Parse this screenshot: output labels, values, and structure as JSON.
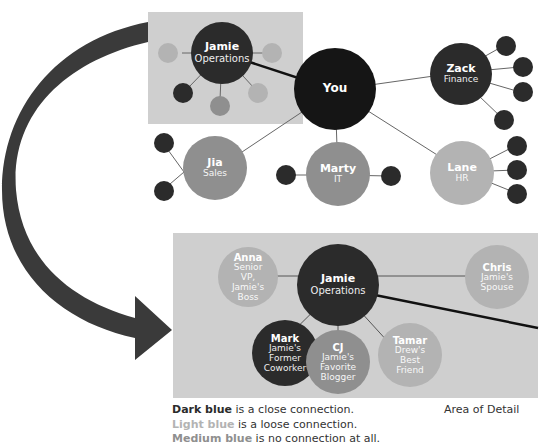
{
  "colors": {
    "dark": "#2b2b2b",
    "center": "#151515",
    "medium": "#8f8f8f",
    "light": "#b3b3b3",
    "panel": "#cfcfcf",
    "arrow": "#3a3a3a",
    "line": "#666666"
  },
  "top_network": {
    "center": {
      "name": "You"
    },
    "nodes": [
      {
        "name": "Jamie",
        "sub": "Operations"
      },
      {
        "name": "Zack",
        "sub": "Finance"
      },
      {
        "name": "Jia",
        "sub": "Sales"
      },
      {
        "name": "Marty",
        "sub": "IT"
      },
      {
        "name": "Lane",
        "sub": "HR"
      }
    ]
  },
  "detail": {
    "center": {
      "name": "Jamie",
      "sub": "Operations"
    },
    "nodes": [
      {
        "name": "Anna",
        "sub": "Senior VP, Jamie's Boss",
        "lines": [
          "Senior",
          "VP,",
          "Jamie's",
          "Boss"
        ]
      },
      {
        "name": "Chris",
        "sub": "Jamie's Spouse",
        "lines": [
          "Jamie's",
          "Spouse"
        ]
      },
      {
        "name": "Mark",
        "sub": "Jamie's Former Coworker",
        "lines": [
          "Jamie's",
          "Former",
          "Coworker"
        ]
      },
      {
        "name": "CJ",
        "sub": "Jamie's Favorite Blogger",
        "lines": [
          "Jamie's",
          "Favorite",
          "Blogger"
        ]
      },
      {
        "name": "Tamar",
        "sub": "Drew's Best Friend",
        "lines": [
          "Drew's",
          "Best",
          "Friend"
        ]
      }
    ]
  },
  "legend": {
    "dark_key": "Dark blue",
    "dark_text": " is a close connection.",
    "light_key": "Light blue",
    "light_text": " is a loose connection.",
    "medium_key": "Medium blue",
    "medium_text": " is no connection at all."
  },
  "area_label": "Area of Detail"
}
